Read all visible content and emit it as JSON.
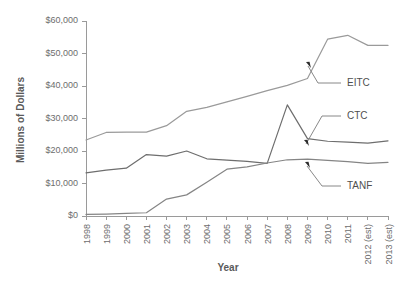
{
  "chart_data": {
    "type": "line",
    "title": "",
    "xlabel": "Year",
    "ylabel": "Millions of Dollars",
    "ylim": [
      0,
      60000
    ],
    "ytick_values": [
      0,
      10000,
      20000,
      30000,
      40000,
      50000,
      60000
    ],
    "ytick_labels": [
      "$0",
      "$10,000",
      "$20,000",
      "$30,000",
      "$40,000",
      "$50,000",
      "$60,000"
    ],
    "grid": false,
    "legend_position": "inline-annotations",
    "categories": [
      "1998",
      "1999",
      "2000",
      "2001",
      "2002",
      "2003",
      "2004",
      "2005",
      "2006",
      "2007",
      "2008",
      "2009",
      "2010",
      "2011",
      "2012 (est)",
      "2013 (est)"
    ],
    "series": [
      {
        "name": "EITC",
        "color": "#9a9a9a",
        "values": [
          23400,
          25700,
          25800,
          25800,
          27800,
          32200,
          33400,
          35100,
          36800,
          38600,
          40200,
          42300,
          54400,
          55600,
          52500,
          52500
        ]
      },
      {
        "name": "CTC",
        "color": "#6e6e6e",
        "values": [
          13300,
          14100,
          14700,
          18900,
          18400,
          20000,
          17600,
          17200,
          16800,
          16200,
          34200,
          23800,
          23000,
          22700,
          22400,
          23100
        ]
      },
      {
        "name": "TANF",
        "color": "#858585",
        "values": [
          500,
          600,
          800,
          1000,
          5200,
          6500,
          10400,
          14400,
          15100,
          16300,
          17300,
          17500,
          17100,
          16700,
          16200,
          16500
        ]
      }
    ],
    "annotations": [
      {
        "label": "EITC",
        "target_category": "2010",
        "target_value": 47000
      },
      {
        "label": "CTC",
        "target_category": "2009",
        "target_value": 23100
      },
      {
        "label": "TANF",
        "target_category": "2010",
        "target_value": 16400
      }
    ]
  }
}
